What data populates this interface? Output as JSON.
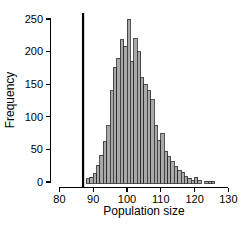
{
  "chart_data": {
    "type": "bar",
    "subtype": "histogram",
    "title": "",
    "xlabel": "Population size",
    "ylabel": "Frequency",
    "xlim": [
      80,
      130
    ],
    "ylim": [
      0,
      250
    ],
    "x_ticks": [
      80,
      90,
      100,
      110,
      120,
      130
    ],
    "y_ticks": [
      0,
      50,
      100,
      150,
      200,
      250
    ],
    "grid": "off",
    "legend": "none",
    "bin_width": 1,
    "bin_start": 88,
    "bins": [
      88,
      89,
      90,
      91,
      92,
      93,
      94,
      95,
      96,
      97,
      98,
      99,
      100,
      101,
      102,
      103,
      104,
      105,
      106,
      107,
      108,
      109,
      110,
      111,
      112,
      113,
      114,
      115,
      116,
      117,
      118,
      119,
      120,
      121,
      122,
      123,
      124,
      125
    ],
    "frequencies": [
      5,
      7,
      13,
      26,
      41,
      62,
      86,
      140,
      175,
      190,
      218,
      208,
      250,
      185,
      220,
      200,
      160,
      150,
      140,
      126,
      87,
      64,
      75,
      47,
      39,
      31,
      24,
      18,
      15,
      8,
      6,
      3,
      7,
      3,
      0,
      1,
      1,
      1
    ],
    "vline_x": 87,
    "colors": {
      "bar_fill": "#a9a9a9",
      "bar_stroke": "#2b2b2b",
      "axis": "#000000",
      "vline": "#000000",
      "background": "#ffffff"
    }
  }
}
